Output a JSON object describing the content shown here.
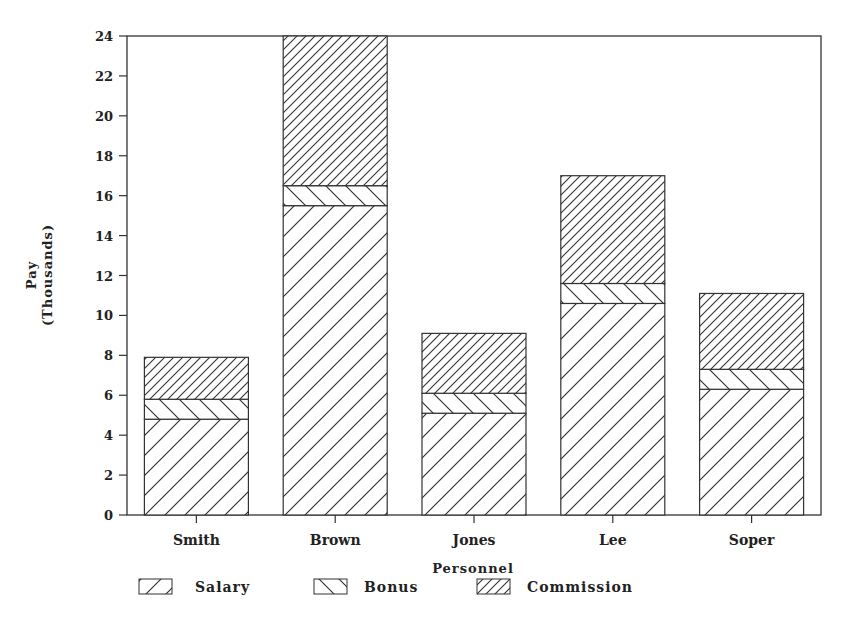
{
  "chart_data": {
    "type": "bar",
    "stacked": true,
    "title": "",
    "title_note": "Title clipped at top of image; only lower edge of glyphs visible",
    "xlabel": "Personnel",
    "ylabel": "Pay",
    "ylabel_sub": "(Thousands)",
    "ylim": [
      0,
      24
    ],
    "yticks": [
      0,
      2,
      4,
      6,
      8,
      10,
      12,
      14,
      16,
      18,
      20,
      22,
      24
    ],
    "grid": false,
    "legend_position": "bottom",
    "categories": [
      "Smith",
      "Brown",
      "Jones",
      "Lee",
      "Soper"
    ],
    "series": [
      {
        "name": "Salary",
        "pattern": "wide-forward-hatch",
        "values": [
          4.8,
          15.5,
          5.1,
          10.6,
          6.3
        ]
      },
      {
        "name": "Bonus",
        "pattern": "backward-hatch",
        "values": [
          1.0,
          1.0,
          1.0,
          1.0,
          1.0
        ]
      },
      {
        "name": "Commission",
        "pattern": "dense-forward-hatch",
        "values": [
          2.1,
          7.5,
          3.0,
          5.4,
          3.8
        ]
      }
    ],
    "totals": [
      7.9,
      24.0,
      9.1,
      17.0,
      11.1
    ]
  },
  "legend": {
    "items": [
      {
        "label": "Salary",
        "pattern": "salary"
      },
      {
        "label": "Bonus",
        "pattern": "bonus"
      },
      {
        "label": "Commission",
        "pattern": "commission"
      }
    ]
  },
  "colors": {
    "ink": "#222222",
    "background": "#ffffff"
  }
}
